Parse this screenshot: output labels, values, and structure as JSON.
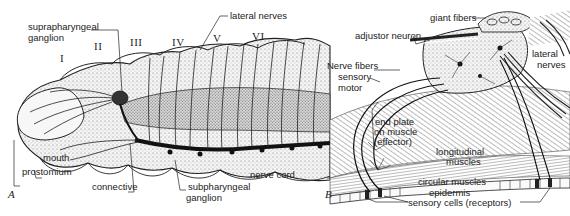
{
  "figure": {
    "panel_a": {
      "letter": "A",
      "segments": [
        "I",
        "II",
        "III",
        "IV",
        "V",
        "VI"
      ],
      "labels": {
        "suprapharyngeal_1": "suprapharyngeal",
        "suprapharyngeal_2": "ganglion",
        "lateral_nerves": "lateral nerves",
        "mouth": "mouth",
        "prostomium": "prostomium",
        "connective": "connective",
        "subpharyngeal_1": "subpharyngeal",
        "subpharyngeal_2": "ganglion",
        "nerve_cord": "nerve cord"
      }
    },
    "panel_b": {
      "letter": "B",
      "labels": {
        "giant_fibers": "giant fibers",
        "adjustor_neuron": "adjustor neuron",
        "lateral_1": "lateral",
        "lateral_2": "nerves",
        "nerve_fibers": "Nerve fibers",
        "sensory": "sensory",
        "motor": "motor",
        "end_plate_1": "end plate",
        "end_plate_2": "on muscle",
        "end_plate_3": "(effector)",
        "longitudinal_1": "longitudinal",
        "longitudinal_2": "muscles",
        "circular_muscles": "circular muscles",
        "epidermis": "epidermis",
        "sensory_cells": "sensory cells (receptors)"
      }
    }
  }
}
